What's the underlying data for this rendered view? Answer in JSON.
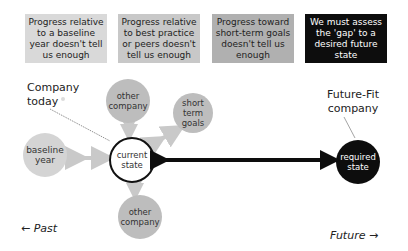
{
  "header_boxes": [
    {
      "text": "Progress relative to a baseline year doesn't tell us enough",
      "bg": "#d9d9d9",
      "x": 25
    },
    {
      "text": "Progress relative to best practice or peers doesn't tell us enough",
      "bg": "#c8c8c8",
      "x": 118
    },
    {
      "text": "Progress toward short-term goals doesn't tell us enough",
      "bg": "#b0b0b0",
      "x": 212
    },
    {
      "text": "We must assess the 'gap' to a desired future state",
      "bg": "#0d0d0d",
      "x": 305
    }
  ],
  "labels": {
    "company_today": "Company today",
    "future_fit": "Future-Fit company",
    "past": "← Past",
    "future": "Future →"
  },
  "nodes": {
    "other_company_top": "other company",
    "short_term_goals": "short term goals",
    "baseline_year": "baseline year",
    "current_state": "current state",
    "required_state": "required state",
    "other_company_bottom": "other company"
  },
  "colors": {
    "light_circle": "#d4d4d4",
    "mid_circle": "#bdbdbd",
    "dark": "#0d0d0d",
    "arrow_light": "#c9c9c9"
  }
}
